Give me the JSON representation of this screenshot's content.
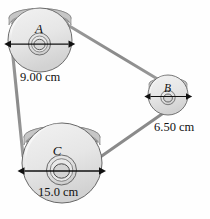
{
  "figure": {
    "kind": "pulley-belt-diagram",
    "background_color": "#fefefe",
    "ink_color": "#111111",
    "belt_color": "#8e8e8e",
    "pulley_face_color": "#e4e4e4",
    "pulley_rim_color": "#b8b8b8"
  },
  "pulleys": [
    {
      "id": "A",
      "label": "A",
      "diameter_label": "9.00 cm",
      "diameter_cm": 9.0,
      "position": "top-left"
    },
    {
      "id": "B",
      "label": "B",
      "diameter_label": "6.50 cm",
      "diameter_cm": 6.5,
      "position": "right"
    },
    {
      "id": "C",
      "label": "C",
      "diameter_label": "15.0 cm",
      "diameter_cm": 15.0,
      "position": "bottom-left"
    }
  ],
  "belt": {
    "segments": [
      "A-B",
      "B-C",
      "C-A"
    ],
    "description": "belt wraps around pulleys A, B and C"
  }
}
